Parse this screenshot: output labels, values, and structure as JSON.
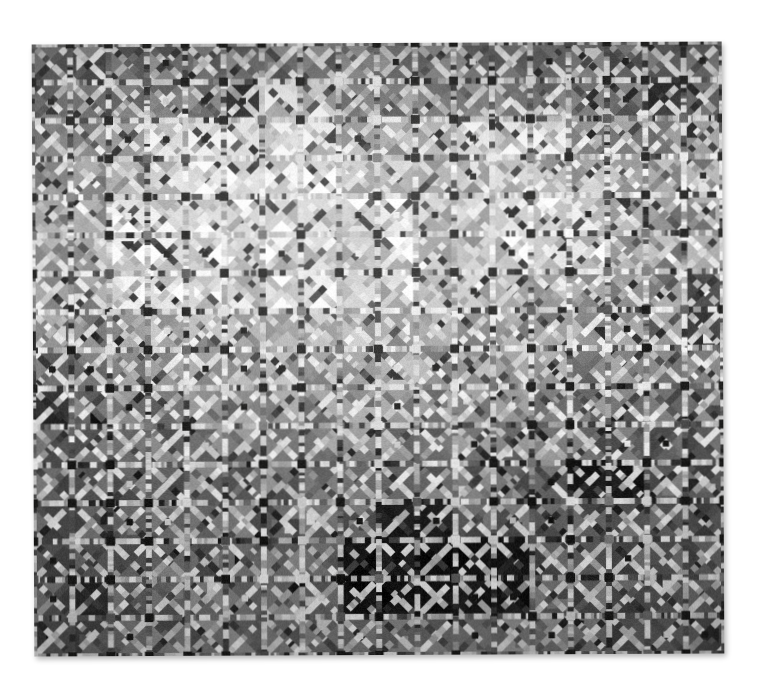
{
  "image": {
    "kind": "photograph",
    "subject": "patchwork quilt",
    "background_color": "#ffffff",
    "color_mode": "grayscale",
    "canvas_width": 762,
    "canvas_height": 692
  },
  "quilt": {
    "label": "String-pieced patchwork quilt",
    "bounds": {
      "left": 33,
      "top": 43,
      "width": 690,
      "height": 612
    },
    "rotation_deg": -0.25,
    "grid": {
      "columns": 18,
      "rows": 16,
      "block_pitch": 38.3
    },
    "block": {
      "structure": "diagonal sashing cross with four half-square-triangle quadrants",
      "sashing_width_ratio": 0.165,
      "center_square_ratio": 0.12
    },
    "palette": {
      "brightest": "#e8e6e2",
      "light": "#cfccc6",
      "mid_light": "#a8a5a0",
      "mid": "#8a8783",
      "mid_dark": "#666360",
      "dark": "#464442",
      "darkest": "#191817",
      "near_black": "#0c0c0b",
      "sashing_light": "#e2e0db",
      "sashing_dark": "#4a4845",
      "intersection_dot": "#131312"
    },
    "tonal_map_note": "bright band across upper-middle rows, gradual darkening downward, very dark cluster lower-center",
    "row_base_luma": [
      96,
      104,
      150,
      178,
      188,
      182,
      170,
      158,
      140,
      124,
      110,
      96,
      84,
      74,
      80,
      88
    ],
    "col_base_luma": [
      80,
      96,
      120,
      140,
      150,
      156,
      158,
      160,
      162,
      160,
      158,
      152,
      146,
      138,
      124,
      106,
      92,
      80
    ],
    "dark_patches": [
      {
        "col": 8,
        "row": 13,
        "w": 3,
        "h": 2,
        "luma": 18
      },
      {
        "col": 9,
        "row": 12,
        "w": 2,
        "h": 1,
        "luma": 24
      },
      {
        "col": 11,
        "row": 13,
        "w": 2,
        "h": 2,
        "luma": 22
      },
      {
        "col": 14,
        "row": 11,
        "w": 2,
        "h": 1,
        "luma": 26
      },
      {
        "col": 5,
        "row": 1,
        "w": 1,
        "h": 1,
        "luma": 28
      },
      {
        "col": 16,
        "row": 1,
        "w": 1,
        "h": 1,
        "luma": 30
      },
      {
        "col": 4,
        "row": 3,
        "w": 1,
        "h": 1,
        "luma": 26
      },
      {
        "col": 1,
        "row": 14,
        "w": 1,
        "h": 1,
        "luma": 30
      },
      {
        "col": 17,
        "row": 6,
        "w": 1,
        "h": 2,
        "luma": 48
      },
      {
        "col": 0,
        "row": 9,
        "w": 1,
        "h": 1,
        "luma": 40
      }
    ],
    "bright_patches": [
      {
        "col": 3,
        "row": 2,
        "w": 5,
        "h": 2,
        "luma": 225
      },
      {
        "col": 10,
        "row": 2,
        "w": 4,
        "h": 1,
        "luma": 228
      },
      {
        "col": 2,
        "row": 4,
        "w": 8,
        "h": 3,
        "luma": 214
      },
      {
        "col": 12,
        "row": 4,
        "w": 3,
        "h": 2,
        "luma": 206
      },
      {
        "col": 6,
        "row": 1,
        "w": 2,
        "h": 1,
        "luma": 210
      }
    ]
  },
  "render": {
    "seed": 20240713,
    "stripe_segments_min": 5,
    "stripe_segments_max": 11
  }
}
